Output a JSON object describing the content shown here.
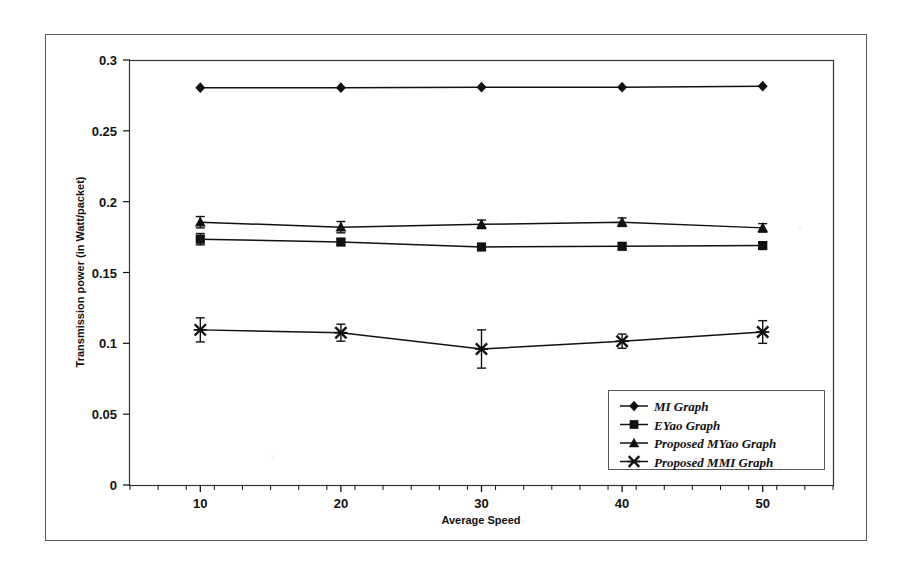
{
  "chart_data": {
    "type": "line",
    "title": "",
    "xlabel": "Average Speed",
    "ylabel": "Transmission power  (in Watt/packet)",
    "x": [
      10,
      20,
      30,
      40,
      50
    ],
    "xticklabels": [
      "10",
      "20",
      "30",
      "40",
      "50"
    ],
    "xlim": [
      5,
      55
    ],
    "ylim": [
      0,
      0.3
    ],
    "yticks": [
      0,
      0.05,
      0.1,
      0.15,
      0.2,
      0.25,
      0.3
    ],
    "yticklabels": [
      "0",
      "0.05",
      "0.1",
      "0.15",
      "0.2",
      "0.25",
      "0.3"
    ],
    "grid": false,
    "legend_position": "lower right",
    "series": [
      {
        "name": "MI Graph",
        "marker": "diamond",
        "values": [
          0.2805,
          0.2805,
          0.2808,
          0.2808,
          0.2815
        ],
        "errors": [
          0,
          0,
          0,
          0,
          0
        ]
      },
      {
        "name": "EYao Graph",
        "marker": "square",
        "values": [
          0.1735,
          0.1715,
          0.168,
          0.1685,
          0.169
        ],
        "errors": [
          0.004,
          0.002,
          0.002,
          0.002,
          0.002
        ]
      },
      {
        "name": "Proposed MYao Graph",
        "marker": "triangle",
        "values": [
          0.1855,
          0.182,
          0.184,
          0.1855,
          0.1815
        ],
        "errors": [
          0.004,
          0.004,
          0.003,
          0.003,
          0.003
        ]
      },
      {
        "name": "Proposed MMI Graph",
        "marker": "cross",
        "values": [
          0.1095,
          0.1075,
          0.096,
          0.1015,
          0.108
        ],
        "errors": [
          0.0085,
          0.006,
          0.0135,
          0.005,
          0.008
        ]
      }
    ]
  },
  "legend": {
    "entries": [
      {
        "label": "MI Graph"
      },
      {
        "label": "EYao Graph"
      },
      {
        "label": "Proposed MYao Graph"
      },
      {
        "label": "Proposed MMI Graph"
      }
    ]
  },
  "colors": {
    "ink": "#111111",
    "frame": "#444444",
    "page": "#ffffff"
  }
}
